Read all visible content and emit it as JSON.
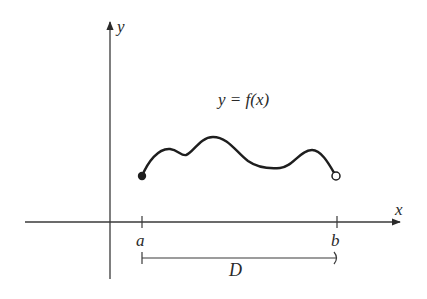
{
  "diagram": {
    "y_axis_label": "y",
    "x_axis_label": "x",
    "function_label": "y = f(x)",
    "tick_a_label": "a",
    "tick_b_label": "b",
    "domain_label": "D",
    "colors": {
      "ink": "#2a2a2a",
      "background": "#ffffff"
    },
    "curve": {
      "start": {
        "x": 142,
        "y": 176,
        "style": "filled"
      },
      "end": {
        "x": 336,
        "y": 176,
        "style": "open"
      }
    }
  }
}
